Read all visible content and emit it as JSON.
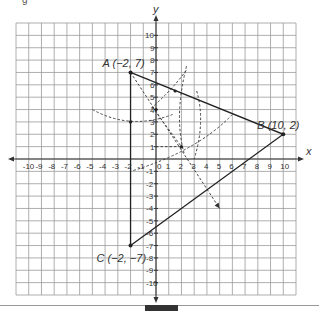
{
  "figure": {
    "caption_fragment": "g",
    "x_axis_label": "x",
    "y_axis_label": "y",
    "x_ticks": [
      -10,
      -9,
      -8,
      -7,
      -6,
      -5,
      -4,
      -3,
      -2,
      -1,
      0,
      1,
      2,
      3,
      4,
      5,
      6,
      7,
      8,
      9,
      10
    ],
    "y_ticks": [
      10,
      9,
      8,
      7,
      6,
      5,
      4,
      3,
      2,
      1,
      -1,
      -2,
      -3,
      -4,
      -5,
      -6,
      -7,
      -8,
      -9,
      -10
    ],
    "grid_range": {
      "xmin": -11,
      "xmax": 11,
      "ymin": -11,
      "ymax": 11
    },
    "points": [
      {
        "name": "A",
        "coords": "(−2, 7)",
        "x": -2,
        "y": 7
      },
      {
        "name": "B",
        "coords": "(10, 2)",
        "x": 10,
        "y": 2
      },
      {
        "name": "C",
        "coords": "(−2, −7)",
        "x": -2,
        "y": -7
      }
    ],
    "triangle": "ABC",
    "constructions": "dashed compass arcs and angle bisector from A with arrow toward (5, −4)"
  }
}
